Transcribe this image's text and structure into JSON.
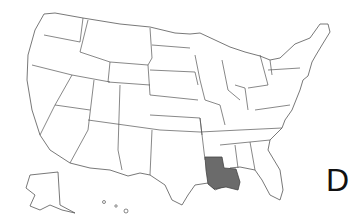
{
  "map": {
    "subject": "United States",
    "highlighted_state": "Louisiana",
    "highlight_color": "#6b6b6b",
    "border_color": "#555555",
    "background": "#ffffff"
  },
  "label": {
    "text": "D"
  }
}
